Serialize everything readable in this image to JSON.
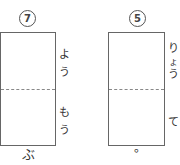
{
  "problems": [
    {
      "number": "7",
      "side_kana_top": [
        "よ",
        "う"
      ],
      "side_kana_bottom": [
        "も",
        "う"
      ],
      "below": "ぶ"
    },
    {
      "number": "5",
      "side_kana_top": [
        "り",
        "ょ",
        "う"
      ],
      "side_kana_bottom": [
        "て"
      ],
      "below": "。"
    }
  ]
}
